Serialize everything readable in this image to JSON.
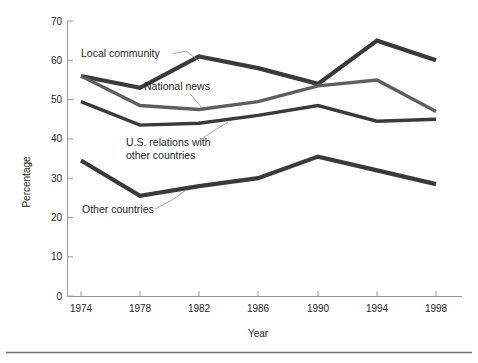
{
  "chart_data": {
    "type": "line",
    "title": "",
    "subtitle": "",
    "xlabel": "Year",
    "ylabel": "Percentage",
    "categories": [
      "1974",
      "1978",
      "1982",
      "1986",
      "1990",
      "1994",
      "1998"
    ],
    "x": [
      1974,
      1978,
      1982,
      1986,
      1990,
      1994,
      1998
    ],
    "xlim": [
      1972,
      2000
    ],
    "ylim": [
      0,
      70
    ],
    "yticks": [
      0,
      10,
      20,
      30,
      40,
      50,
      60,
      70
    ],
    "ytick_labels": [
      "0",
      "10",
      "20",
      "30",
      "40",
      "50",
      "60",
      "70"
    ],
    "grid": false,
    "legend": "none (direct labels on lines)",
    "series": [
      {
        "name": "Local community",
        "color": "#3a3a3a",
        "values": [
          56,
          53,
          61,
          58,
          54,
          65,
          60
        ]
      },
      {
        "name": "National news",
        "color": "#5e5e5e",
        "values": [
          56,
          48.5,
          47.5,
          49.5,
          53.5,
          55,
          47
        ]
      },
      {
        "name": "U.S. relations with other countries",
        "color": "#3a3a3a",
        "values": [
          49.5,
          43.5,
          44,
          46,
          48.5,
          44.5,
          45
        ]
      },
      {
        "name": "Other countries",
        "color": "#3a3a3a",
        "values": [
          34.5,
          25.5,
          28,
          30,
          35.5,
          32,
          28.5
        ]
      }
    ],
    "annotations": [
      {
        "id": "local-community",
        "text": "Local community"
      },
      {
        "id": "national-news",
        "text": "National news"
      },
      {
        "id": "us-relations-line1",
        "text": "U.S. relations with"
      },
      {
        "id": "us-relations-line2",
        "text": "other countries"
      },
      {
        "id": "other-countries",
        "text": "Other countries"
      }
    ]
  },
  "axes": {
    "y_title": "Percentage",
    "x_title": "Year",
    "y_ticks": [
      "70",
      "60",
      "50",
      "40",
      "30",
      "20",
      "10",
      "0"
    ],
    "x_ticks": [
      "1974",
      "1978",
      "1982",
      "1986",
      "1990",
      "1994",
      "1998"
    ]
  },
  "colors": {
    "line_dark": "#3a3a3a",
    "line_mid": "#5e5e5e",
    "axis": "#9a9a9a",
    "text": "#231f20",
    "rule": "#6f6f6f",
    "background": "#ffffff"
  }
}
